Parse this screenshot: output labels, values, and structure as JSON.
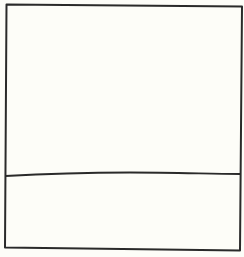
{
  "diagram": {
    "background_color": "#fdfdf8",
    "stroke_color": "#2a2a2a",
    "stroke_width": 2,
    "sections": [
      {
        "name": "upper-section",
        "label": ""
      },
      {
        "name": "lower-section",
        "label": ""
      }
    ]
  }
}
